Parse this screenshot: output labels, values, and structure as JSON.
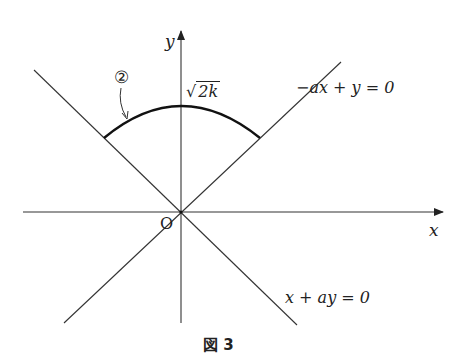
{
  "figure": {
    "caption": "図 3",
    "axes": {
      "x_label": "x",
      "y_label": "y",
      "origin_label": "O"
    },
    "lines": [
      {
        "id": "line1",
        "equation": "−ax + y = 0",
        "description": "line through origin with positive slope (upper-right / lower-left)"
      },
      {
        "id": "line2",
        "equation": "x + ay = 0",
        "description": "line through origin with negative slope (upper-left / lower-right)"
      }
    ],
    "arc": {
      "label": "②",
      "peak_label_radicand": "2k",
      "peak_label_symbol": "√",
      "description": "bold arc of circle centered at O, between the two lines in the upper region, peaking at y = √(2k)"
    },
    "colors": {
      "stroke": "#333333",
      "arc": "#111111",
      "background": "#ffffff"
    }
  }
}
